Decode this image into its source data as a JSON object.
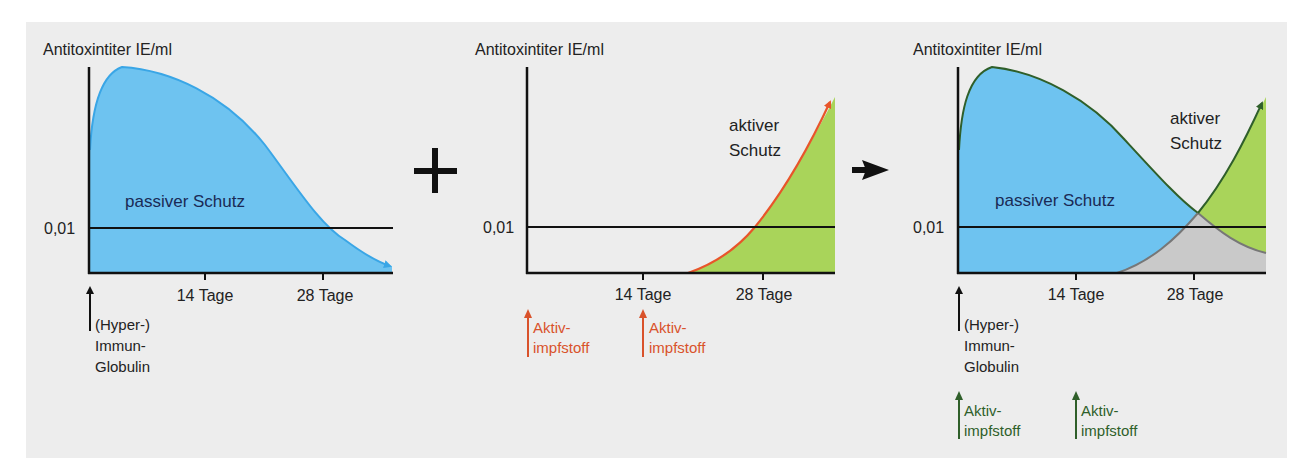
{
  "figure": {
    "background": "#ededed",
    "colors": {
      "passive_fill": "#6ec3f0",
      "passive_line": "#3aa6e6",
      "active_fill": "#a9d45a",
      "active_line_orange": "#e8552a",
      "overlap_fill": "#c9c9c9",
      "dark_green": "#2f5f2a",
      "orange_label": "#d9522b",
      "axis": "#111111",
      "text": "#222222"
    },
    "operators": {
      "plus": "+",
      "arrow": "→"
    }
  },
  "panels": [
    {
      "id": "passive",
      "y_label": "Antitoxintiter IE/ml",
      "threshold_label": "0,01",
      "x_ticks": [
        "14 Tage",
        "28 Tage"
      ],
      "area_label": "passiver Schutz",
      "annotations": [
        {
          "lines": [
            "(Hyper-)",
            "Immun-",
            "Globulin"
          ],
          "color": "dark"
        }
      ]
    },
    {
      "id": "active",
      "y_label": "Antitoxintiter IE/ml",
      "threshold_label": "0,01",
      "x_ticks": [
        "14 Tage",
        "28 Tage"
      ],
      "area_label_lines": [
        "aktiver",
        "Schutz"
      ],
      "annotations": [
        {
          "lines": [
            "Aktiv-",
            "impfstoff"
          ],
          "color": "orange"
        },
        {
          "lines": [
            "Aktiv-",
            "impfstoff"
          ],
          "color": "orange"
        }
      ]
    },
    {
      "id": "combined",
      "y_label": "Antitoxintiter IE/ml",
      "threshold_label": "0,01",
      "x_ticks": [
        "14 Tage",
        "28 Tage"
      ],
      "area_label": "passiver Schutz",
      "area_label_lines": [
        "aktiver",
        "Schutz"
      ],
      "annotations": [
        {
          "lines": [
            "(Hyper-)",
            "Immun-",
            "Globulin"
          ],
          "color": "dark"
        },
        {
          "lines": [
            "Aktiv-",
            "impfstoff"
          ],
          "color": "green"
        },
        {
          "lines": [
            "Aktiv-",
            "impfstoff"
          ],
          "color": "green"
        }
      ]
    }
  ]
}
